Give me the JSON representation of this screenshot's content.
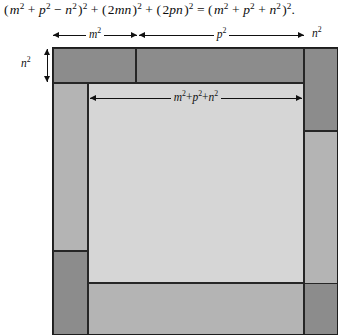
{
  "equation": {
    "text": "( m² + p² − n² )² + ( 2mn )² + ( 2pn )² = ( m² + p² + n² )².",
    "terms": [
      "( m² + p² − n² )²",
      "( 2mn )²",
      "( 2pn )²",
      "( m² + p² + n² )²"
    ]
  },
  "labels": {
    "top_left": "m²",
    "top_middle": "p²",
    "top_right": "n²",
    "left_side": "n²",
    "inner_square": "m²+p²+n²"
  },
  "colors": {
    "dark": "#8c8c8c",
    "medium": "#b4b4b4",
    "light": "#d6d6d6",
    "frame_fill": "#c9c9c9",
    "stroke": "#262626",
    "background": "#ffffff"
  },
  "figure": {
    "outer_side": "m²+p²+n² plus border strips",
    "regions": [
      {
        "name": "top-left-rectangle",
        "shade": "dark",
        "x": 0,
        "y": 0,
        "w": 83,
        "h": 35
      },
      {
        "name": "top-middle-rectangle",
        "shade": "dark",
        "x": 83,
        "y": 0,
        "w": 168,
        "h": 35
      },
      {
        "name": "top-right-rectangle",
        "shade": "dark",
        "x": 251,
        "y": 0,
        "w": 35,
        "h": 83
      },
      {
        "name": "right-upper-rectangle",
        "shade": "medium",
        "x": 251,
        "y": 83,
        "w": 35,
        "h": 168
      },
      {
        "name": "left-upper-rectangle",
        "shade": "medium",
        "x": 0,
        "y": 35,
        "w": 35,
        "h": 168
      },
      {
        "name": "left-lower-rectangle",
        "shade": "dark",
        "x": 0,
        "y": 203,
        "w": 35,
        "h": 85
      },
      {
        "name": "bottom-left-rectangle",
        "shade": "medium",
        "x": 35,
        "y": 235,
        "w": 216,
        "h": 53
      },
      {
        "name": "bottom-right-rectangle",
        "shade": "dark",
        "x": 251,
        "y": 235,
        "w": 35,
        "h": 53
      },
      {
        "name": "inner-square",
        "shade": "light",
        "x": 35,
        "y": 35,
        "w": 216,
        "h": 200
      }
    ]
  }
}
